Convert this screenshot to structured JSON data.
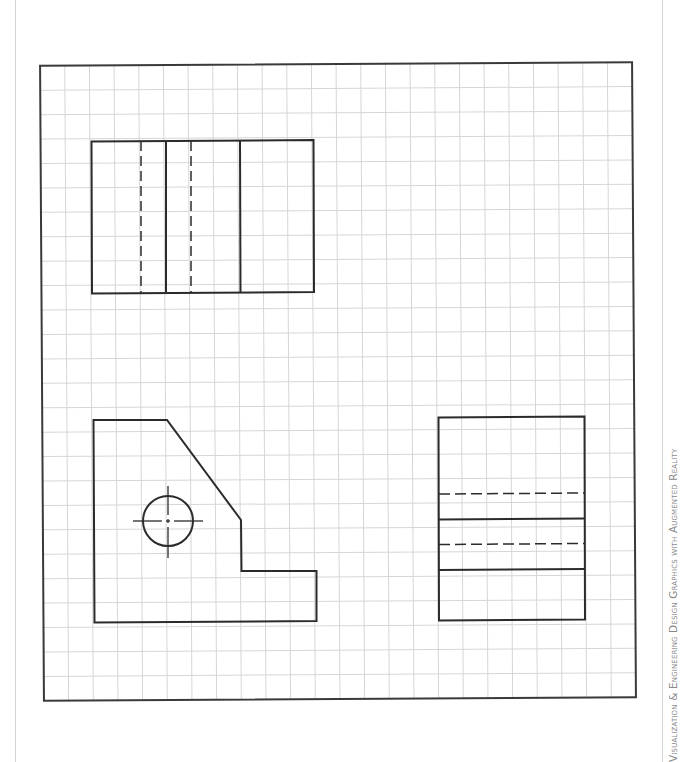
{
  "page": {
    "caption": "Visualization & Engineering Design Graphics with Augmented Reality"
  },
  "sheet": {
    "grid": {
      "columns": 24,
      "rows": 26,
      "cell_px": 24.7,
      "grid_color": "#d6d6d6",
      "border_color": "#3a3a3a"
    },
    "views": [
      {
        "name": "top-view",
        "outline": "rectangle",
        "solid_lines": 2,
        "hidden_lines": 2
      },
      {
        "name": "front-view",
        "outline": "notched profile with chamfer",
        "features": [
          "through-hole with centerlines"
        ]
      },
      {
        "name": "right-side-view",
        "outline": "rectangle",
        "solid_lines": 2,
        "hidden_lines": 2
      }
    ],
    "line_colors": {
      "visible": "#2b2b2b",
      "hidden": "#3a3a3a",
      "center": "#2b2b2b"
    }
  }
}
